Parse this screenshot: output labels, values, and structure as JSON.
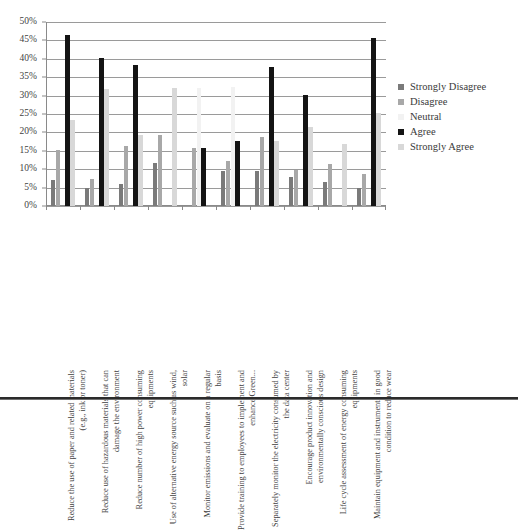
{
  "chart_data": {
    "type": "bar",
    "title": "",
    "subtitle": "",
    "xlabel": "",
    "ylabel": "",
    "ylim": [
      0,
      50
    ],
    "ytick_labels": [
      "0%",
      "5%",
      "10%",
      "15%",
      "20%",
      "25%",
      "30%",
      "35%",
      "40%",
      "45%",
      "50%"
    ],
    "ytick_values": [
      0,
      5,
      10,
      15,
      20,
      25,
      30,
      35,
      40,
      45,
      50
    ],
    "grid": true,
    "legend_position": "right",
    "categories": [
      "Reduce the use of paper and related materials (e.g., ink or toner)",
      "Reduce use of hazardous materials that can damage the environment",
      "Reduce number of high power consuming equipments",
      "Use of alternative energy source such as wind, solar",
      "Monitor emissions and evaluate on a regular basis",
      "Provide training to employees to implement and enhance Green...",
      "Separately monitor the electricity consumed by the data center",
      "Encourage product innovation and environmentally conscious design",
      "Life cycle assessment of energy consuming equipments",
      "Maintain equipment and instruments in good condition to reduce wear"
    ],
    "series": [
      {
        "name": "Strongly Disagree",
        "color": "#7a7a7a",
        "values": [
          7.0,
          5.0,
          6.0,
          11.8,
          0.0,
          9.5,
          9.6,
          7.8,
          6.5,
          4.8
        ]
      },
      {
        "name": "Disagree",
        "color": "#a8a8a8",
        "values": [
          15.3,
          7.3,
          16.2,
          19.2,
          15.8,
          12.3,
          18.8,
          9.7,
          11.5,
          8.8
        ]
      },
      {
        "name": "Neutral",
        "color": "#f2f2f2",
        "values": [
          0.0,
          0.0,
          0.0,
          0.0,
          32.0,
          32.3,
          0.0,
          0.0,
          0.0,
          0.0
        ]
      },
      {
        "name": "Agree",
        "color": "#141414",
        "values": [
          46.5,
          40.2,
          38.2,
          0.0,
          15.8,
          17.8,
          37.8,
          30.2,
          0.0,
          45.6
        ]
      },
      {
        "name": "Strongly Agree",
        "color": "#d8d8d8",
        "values": [
          23.5,
          31.7,
          19.2,
          32.0,
          0.0,
          0.0,
          17.8,
          21.5,
          16.9,
          25.3
        ]
      }
    ]
  },
  "legend": {
    "items": [
      {
        "label": "Strongly Disagree",
        "color": "#7a7a7a"
      },
      {
        "label": "Disagree",
        "color": "#a8a8a8"
      },
      {
        "label": "Neutral",
        "color": "#f2f2f2"
      },
      {
        "label": "Agree",
        "color": "#141414"
      },
      {
        "label": "Strongly Agree",
        "color": "#d8d8d8"
      }
    ]
  }
}
